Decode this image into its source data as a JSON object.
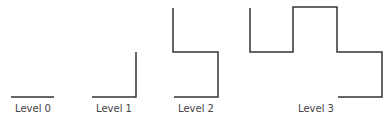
{
  "diagram": {
    "stroke_color": "#333333",
    "levels": [
      {
        "label": "Level 0",
        "label_x": 33,
        "points": "11,97 54,97"
      },
      {
        "label": "Level 1",
        "label_x": 114,
        "points": "92,97 136,97 136,52"
      },
      {
        "label": "Level 2",
        "label_x": 196,
        "points": "174,97 218,97 218,52 173,52 173,8"
      },
      {
        "label": "Level 3",
        "label_x": 316,
        "points": "338,97 382,97 382,52 337,52 337,7 293,7 293,52 250,52 250,8"
      }
    ]
  }
}
